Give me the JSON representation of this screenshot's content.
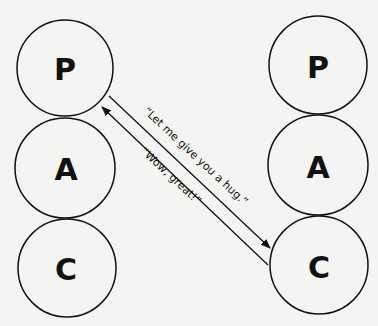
{
  "diagram": {
    "left_person": {
      "states": [
        {
          "label": "P"
        },
        {
          "label": "A"
        },
        {
          "label": "C"
        }
      ]
    },
    "right_person": {
      "states": [
        {
          "label": "P"
        },
        {
          "label": "A"
        },
        {
          "label": "C"
        }
      ]
    },
    "transactions": [
      {
        "text": "“Let me give you a  hug.”",
        "from": "left P",
        "to": "right C"
      },
      {
        "text": "“Wow, great!”",
        "from": "right C",
        "to": "left P"
      }
    ]
  }
}
